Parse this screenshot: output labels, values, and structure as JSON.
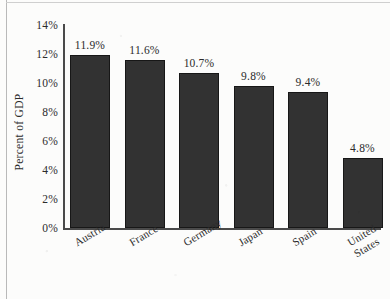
{
  "chart_data": {
    "type": "bar",
    "title": "",
    "xlabel": "",
    "ylabel": "Percent of GDP",
    "ylim": [
      0,
      14
    ],
    "ytick_labels": [
      "0%",
      "2%",
      "4%",
      "6%",
      "8%",
      "10%",
      "12%",
      "14%"
    ],
    "ytick_values": [
      0,
      2,
      4,
      6,
      8,
      10,
      12,
      14
    ],
    "grid": false,
    "legend": null,
    "bar_color": "#323232",
    "categories": [
      "Austria",
      "France",
      "Germany",
      "Japan",
      "Spain",
      "United\nStates"
    ],
    "values": [
      11.9,
      9.8,
      10.7,
      9.8,
      9.4,
      4.8
    ],
    "data_labels": [
      "11.9%",
      "11.6%",
      "10.7%",
      "9.8%",
      "9.4%",
      "4.8%"
    ],
    "points": [
      {
        "category": "Austria",
        "value": 11.9,
        "label": "11.9%"
      },
      {
        "category": "France",
        "value": 11.6,
        "label": "11.6%"
      },
      {
        "category": "Germany",
        "value": 10.7,
        "label": "10.7%"
      },
      {
        "category": "Japan",
        "value": 9.8,
        "label": "9.8%"
      },
      {
        "category": "Spain",
        "value": 9.4,
        "label": "9.4%"
      },
      {
        "category": "United States",
        "value": 4.8,
        "label": "4.8%"
      }
    ]
  }
}
